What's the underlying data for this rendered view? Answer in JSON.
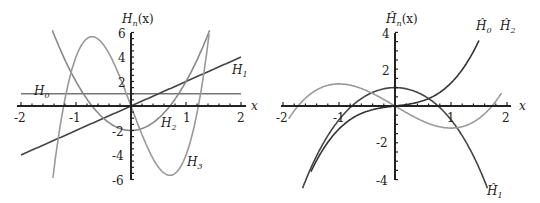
{
  "chart_data": [
    {
      "type": "line",
      "title": "",
      "ylabel": "H_n(x)",
      "xlabel": "x",
      "xlim": [
        -2,
        2
      ],
      "ylim": [
        -6,
        6
      ],
      "xticks": [
        "-2",
        "-1",
        "1",
        "2"
      ],
      "yticks": [
        "6",
        "4",
        "2",
        "-2",
        "-4",
        "-6"
      ],
      "series": [
        {
          "name": "H_0",
          "label_main": "H",
          "label_sub": "0",
          "formula": "1",
          "color": "#777777",
          "xrange": [
            -2,
            2
          ]
        },
        {
          "name": "H_1",
          "label_main": "H",
          "label_sub": "1",
          "formula": "2x",
          "color": "#444444",
          "xrange": [
            -2,
            2
          ]
        },
        {
          "name": "H_2",
          "label_main": "H",
          "label_sub": "2",
          "formula": "4x^2-2",
          "color": "#888888",
          "xrange": [
            -1.43,
            1.43
          ]
        },
        {
          "name": "H_3",
          "label_main": "H",
          "label_sub": "3",
          "formula": "8x^3-12x",
          "color": "#999999",
          "xrange": [
            -1.42,
            1.42
          ]
        }
      ]
    },
    {
      "type": "line",
      "title": "",
      "ylabel": "Ĥ_n(x)",
      "xlabel": "x",
      "xlim": [
        -2,
        2
      ],
      "ylim": [
        -4,
        4
      ],
      "xticks": [
        "-2",
        "-1",
        "1",
        "2"
      ],
      "yticks": [
        "4",
        "2",
        "-2",
        "-4"
      ],
      "series": [
        {
          "name": "Ĥ_0",
          "label_main": "Ĥ",
          "label_sub": "0",
          "color": "#333333",
          "xrange": [
            -1.5,
            1.5
          ]
        },
        {
          "name": "Ĥ_1",
          "label_main": "Ĥ",
          "label_sub": "1",
          "color": "#444444",
          "xrange": [
            -1.65,
            1.65
          ]
        },
        {
          "name": "Ĥ_2",
          "label_main": "Ĥ",
          "label_sub": "2",
          "color": "#999999",
          "xrange": [
            -1.9,
            1.9
          ]
        }
      ]
    }
  ],
  "labels": {
    "left_ylabel": "H",
    "left_ylabel_sub": "n",
    "left_ylabel_arg": "(x)",
    "right_ylabel": "Ĥ",
    "right_ylabel_sub": "n",
    "right_ylabel_arg": "(x)",
    "xaxis": "x"
  }
}
